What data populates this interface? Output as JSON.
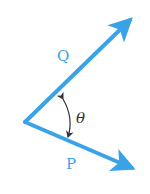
{
  "diagram": {
    "title": "",
    "colors": {
      "vector": "#3aa3e8",
      "label": "#3aa3e8",
      "angle": "#333333",
      "background": "#ffffff"
    },
    "vertex": {
      "x": 25,
      "y": 122
    },
    "vectors": [
      {
        "id": "Q",
        "label": "Q",
        "tip": {
          "x": 134,
          "y": 17
        },
        "label_pos": {
          "x": 57,
          "y": 61
        }
      },
      {
        "id": "P",
        "label": "P",
        "tip": {
          "x": 137,
          "y": 171
        },
        "label_pos": {
          "x": 66,
          "y": 169
        }
      }
    ],
    "angle": {
      "label": "θ",
      "label_pos": {
        "x": 76,
        "y": 123
      },
      "between": [
        "Q",
        "P"
      ],
      "arc_direction": "double-headed"
    }
  }
}
